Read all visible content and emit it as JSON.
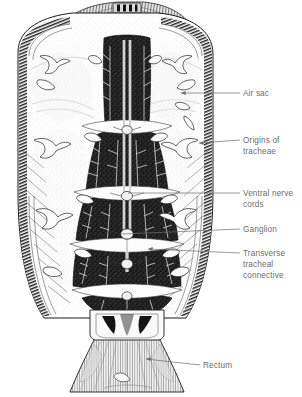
{
  "figure": {
    "background_color": "#ffffff",
    "ink_color": "#1a1a1a",
    "label_color": "#6d6d6d",
    "labels": [
      {
        "id": "air-sac",
        "lines": [
          "Air sac"
        ],
        "text_x": 243,
        "text_y": 96,
        "leader": {
          "x1": 240,
          "y1": 93,
          "x2": 181,
          "y2": 93,
          "arrow": true,
          "arrow_dir": "left"
        }
      },
      {
        "id": "origins-of-tracheae",
        "lines": [
          "Origins of",
          "tracheae"
        ],
        "text_x": 243,
        "text_y": 143,
        "leader": {
          "x1": 240,
          "y1": 140,
          "x2": 199,
          "y2": 143,
          "arrow": true,
          "arrow_dir": "left"
        }
      },
      {
        "id": "ventral-nerve-cords",
        "lines": [
          "Ventral nerve",
          "cords"
        ],
        "text_x": 243,
        "text_y": 196,
        "leader": {
          "x1": 240,
          "y1": 193,
          "x2": 128,
          "y2": 193,
          "arrow": false,
          "arrow_dir": "none"
        }
      },
      {
        "id": "ganglion",
        "lines": [
          "Ganglion"
        ],
        "text_x": 243,
        "text_y": 232,
        "leader": {
          "x1": 240,
          "y1": 229,
          "x2": 122,
          "y2": 234,
          "arrow": false,
          "arrow_dir": "none"
        }
      },
      {
        "id": "transverse-tracheal-connective",
        "lines": [
          "Transverse",
          "tracheal",
          "connective"
        ],
        "text_x": 243,
        "text_y": 256,
        "leader": {
          "x1": 240,
          "y1": 253,
          "x2": 148,
          "y2": 249,
          "arrow": true,
          "arrow_dir": "left"
        }
      },
      {
        "id": "rectum",
        "lines": [
          "Rectum"
        ],
        "text_x": 203,
        "text_y": 368,
        "leader": {
          "x1": 200,
          "y1": 365,
          "x2": 146,
          "y2": 359,
          "arrow": true,
          "arrow_dir": "left"
        }
      }
    ]
  }
}
